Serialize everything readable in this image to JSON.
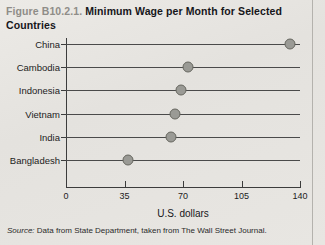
{
  "figure": {
    "number": "Figure B10.2.1.",
    "title": "Minimum Wage per Month for Selected Countries"
  },
  "source": {
    "label": "Source:",
    "text": "Data from State Department, taken from The Wall Street Journal."
  },
  "colors": {
    "background": "#e8e6e2",
    "dot_fill": "#9a9a95",
    "dot_stroke": "#66665f",
    "axis": "#3c3c3c",
    "row_line": "#4a4a4a",
    "figure_number": "#8f8d88",
    "text": "#16161a"
  },
  "chart_data": {
    "type": "scatter",
    "title": "Minimum Wage per Month for Selected Countries",
    "subtitle": "",
    "xlabel": "U.S. dollars",
    "ylabel": "",
    "categories": [
      "China",
      "Cambodia",
      "Indonesia",
      "Vietnam",
      "India",
      "Bangladesh"
    ],
    "values": [
      134,
      73,
      69,
      65,
      63,
      37
    ],
    "xlim": [
      0,
      140
    ],
    "xticks": [
      0,
      35,
      70,
      105,
      140
    ],
    "xtick_labels": [
      "0",
      "35",
      "70",
      "105",
      "140"
    ],
    "grid": false,
    "legend": null,
    "orientation": "horizontal",
    "marker": "filled-circle"
  }
}
